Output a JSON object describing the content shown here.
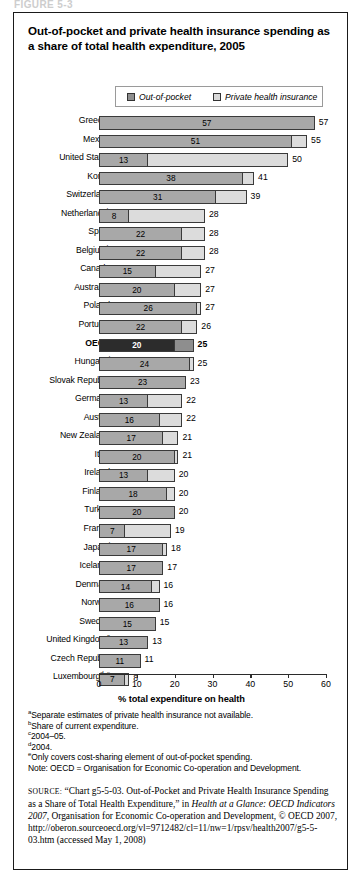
{
  "figure_label": "FIGURE 5-3",
  "title": "Out-of-pocket and private health insurance spending as a share of total health expenditure, 2005",
  "legend": {
    "out_of_pocket": "Out-of-pocket",
    "private_health_insurance": "Private health insurance"
  },
  "colors": {
    "out_of_pocket": "#a8a8a8",
    "private_health_insurance": "#dcdcdc",
    "highlight_out_of_pocket": "#2c2c2c",
    "highlight_private_health_insurance": "#8e8e8e",
    "border": "#3a3a3a"
  },
  "chart_data": {
    "type": "bar",
    "orientation": "horizontal",
    "stacked": true,
    "title": "Out-of-pocket and private health insurance spending as a share of total health expenditure, 2005",
    "xlabel": "% total expenditure on health",
    "ylabel": "",
    "xlim": [
      0,
      60
    ],
    "xticks": [
      0,
      10,
      20,
      30,
      40,
      50,
      60
    ],
    "grid": false,
    "legend_position": "top",
    "legend_entries": [
      "Out-of-pocket",
      "Private health insurance"
    ],
    "series": [
      {
        "name": "Out-of-pocket",
        "values": [
          57,
          51,
          13,
          38,
          31,
          8,
          22,
          22,
          15,
          20,
          26,
          22,
          20,
          24,
          23,
          13,
          16,
          17,
          20,
          13,
          18,
          20,
          7,
          17,
          17,
          14,
          16,
          15,
          13,
          11,
          7
        ]
      },
      {
        "name": "Private health insurance",
        "values": [
          0,
          4,
          37,
          3,
          8,
          20,
          6,
          6,
          12,
          7,
          1,
          4,
          5,
          1,
          0,
          9,
          6,
          4,
          1,
          7,
          2,
          0,
          12,
          1,
          0,
          2,
          0,
          0,
          0,
          0,
          1
        ]
      }
    ],
    "categories": [
      "Greece",
      "Mexico",
      "United States",
      "Korea",
      "Switzerland",
      "Netherlands",
      "Spain",
      "Belgium",
      "Canada",
      "Australia",
      "Poland",
      "Portugal",
      "OECD",
      "Hungary",
      "Slovak Republic",
      "Germany",
      "Austria",
      "New Zealand",
      "Italy",
      "Ireland",
      "Finland",
      "Turkey",
      "France",
      "Japan",
      "Iceland",
      "Denmark",
      "Norway",
      "Sweden",
      "United Kingdom",
      "Czech Republic",
      "Luxembourg"
    ],
    "totals": [
      57,
      55,
      50,
      41,
      39,
      28,
      28,
      28,
      27,
      27,
      27,
      26,
      25,
      25,
      23,
      22,
      22,
      21,
      21,
      20,
      20,
      20,
      19,
      18,
      17,
      16,
      16,
      15,
      13,
      11,
      8
    ]
  },
  "rows": [
    {
      "label": "Greece",
      "sup": "a",
      "oop": 57,
      "phi": 0,
      "total": 57,
      "highlight": false
    },
    {
      "label": "Mexico",
      "sup": "",
      "oop": 51,
      "phi": 4,
      "total": 55,
      "highlight": false
    },
    {
      "label": "United States",
      "sup": "",
      "oop": 13,
      "phi": 37,
      "total": 50,
      "highlight": false
    },
    {
      "label": "Korea",
      "sup": "",
      "oop": 38,
      "phi": 3,
      "total": 41,
      "highlight": false
    },
    {
      "label": "Switzerland",
      "sup": "",
      "oop": 31,
      "phi": 8,
      "total": 39,
      "highlight": false
    },
    {
      "label": "Netherlands",
      "sup": "b",
      "oop": 8,
      "phi": 20,
      "total": 28,
      "highlight": false
    },
    {
      "label": "Spain",
      "sup": "",
      "oop": 22,
      "phi": 6,
      "total": 28,
      "highlight": false
    },
    {
      "label": "Belgium",
      "sup": "b",
      "oop": 22,
      "phi": 6,
      "total": 28,
      "highlight": false
    },
    {
      "label": "Canada",
      "sup": "",
      "oop": 15,
      "phi": 12,
      "total": 27,
      "highlight": false
    },
    {
      "label": "Australia",
      "sup": "c",
      "oop": 20,
      "phi": 7,
      "total": 27,
      "highlight": false
    },
    {
      "label": "Poland",
      "sup": "",
      "oop": 26,
      "phi": 1,
      "total": 27,
      "highlight": false
    },
    {
      "label": "Portugal",
      "sup": "",
      "oop": 22,
      "phi": 4,
      "total": 26,
      "highlight": false
    },
    {
      "label": "OECD",
      "sup": "",
      "oop": 20,
      "phi": 5,
      "total": 25,
      "highlight": true
    },
    {
      "label": "Hungary",
      "sup": "d",
      "oop": 24,
      "phi": 1,
      "total": 25,
      "highlight": false
    },
    {
      "label": "Slovak Republic",
      "sup": "",
      "oop": 23,
      "phi": 0,
      "total": 23,
      "highlight": false
    },
    {
      "label": "Germany",
      "sup": "",
      "oop": 13,
      "phi": 9,
      "total": 22,
      "highlight": false
    },
    {
      "label": "Austria",
      "sup": "",
      "oop": 16,
      "phi": 6,
      "total": 22,
      "highlight": false
    },
    {
      "label": "New Zealand",
      "sup": "",
      "oop": 17,
      "phi": 4,
      "total": 21,
      "highlight": false
    },
    {
      "label": "Italy",
      "sup": "",
      "oop": 20,
      "phi": 1,
      "total": 21,
      "highlight": false
    },
    {
      "label": "Ireland",
      "sup": "",
      "oop": 13,
      "phi": 7,
      "total": 20,
      "highlight": false
    },
    {
      "label": "Finland",
      "sup": "",
      "oop": 18,
      "phi": 2,
      "total": 20,
      "highlight": false
    },
    {
      "label": "Turkey",
      "sup": "",
      "oop": 20,
      "phi": 0,
      "total": 20,
      "highlight": false
    },
    {
      "label": "France",
      "sup": "",
      "oop": 7,
      "phi": 12,
      "total": 19,
      "highlight": false
    },
    {
      "label": "Japan",
      "sup": "d",
      "oop": 17,
      "phi": 1,
      "total": 18,
      "highlight": false
    },
    {
      "label": "Iceland",
      "sup": "a",
      "oop": 17,
      "phi": 0,
      "total": 17,
      "highlight": false
    },
    {
      "label": "Denmark",
      "sup": "",
      "oop": 14,
      "phi": 2,
      "total": 16,
      "highlight": false
    },
    {
      "label": "Norway",
      "sup": "",
      "oop": 16,
      "phi": 0,
      "total": 16,
      "highlight": false
    },
    {
      "label": "Sweden",
      "sup": "",
      "oop": 15,
      "phi": 0,
      "total": 15,
      "highlight": false
    },
    {
      "label": "United Kingdom",
      "sup": "a",
      "oop": 13,
      "phi": 0,
      "total": 13,
      "highlight": false
    },
    {
      "label": "Czech Republic",
      "sup": "",
      "oop": 11,
      "phi": 0,
      "total": 11,
      "highlight": false
    },
    {
      "label": "Luxembourg",
      "sup": "d, e",
      "oop": 7,
      "phi": 1,
      "total": 8,
      "highlight": false
    }
  ],
  "axis": {
    "ticks": [
      "0",
      "10",
      "20",
      "30",
      "40",
      "50",
      "60"
    ],
    "title": "% total expenditure on health"
  },
  "notes": [
    {
      "sup": "a",
      "text": "Separate estimates of private health insurance not available."
    },
    {
      "sup": "b",
      "text": "Share of current expenditure."
    },
    {
      "sup": "c",
      "text": "2004–05."
    },
    {
      "sup": "d",
      "text": "2004."
    },
    {
      "sup": "e",
      "text": "Only covers cost-sharing element of out-of-pocket spending."
    },
    {
      "sup": "",
      "text": "Note: OECD = Organisation for Economic Co-operation and Development."
    }
  ],
  "source": {
    "label": "SOURCE:",
    "chart_ref": "“Chart g5-5-03. Out-of-Pocket and Private Health Insurance Spending as a Share of Total Health Expenditure,” in ",
    "publication": "Health at a Glance: OECD Indicators 2007",
    "publisher": ", Organisation for Economic Co-operation and Development, © OECD 2007, http://oberon",
    "url": ".sourceoecd.org/vl=9712482/cl=11/nw=1/rpsv/health2007/g5-5-03.htm",
    "accessed": "(accessed May 1, 2008)"
  }
}
